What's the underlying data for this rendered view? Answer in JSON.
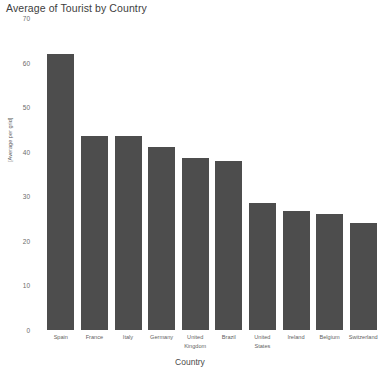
{
  "chart_data": {
    "type": "bar",
    "title": "Average of Tourist by Country",
    "xlabel": "Country",
    "ylabel": "[Average per grid]",
    "categories": [
      "Spain",
      "France",
      "Italy",
      "Germany",
      "United Kingdom",
      "Brazil",
      "United States",
      "Ireland",
      "Belgium",
      "Switzerland"
    ],
    "values": [
      62,
      43.5,
      43.5,
      41,
      38.5,
      38,
      28.5,
      26.8,
      26,
      24
    ],
    "ylim": [
      0,
      70
    ],
    "yticks": [
      0,
      10,
      20,
      30,
      40,
      50,
      60,
      70
    ],
    "ytick_labels": [
      "0",
      "10",
      "20",
      "30",
      "40",
      "50",
      "60",
      "70"
    ],
    "grid": false,
    "legend": null,
    "bar_color": "#4d4d4d",
    "background_color": "#ffffff"
  }
}
